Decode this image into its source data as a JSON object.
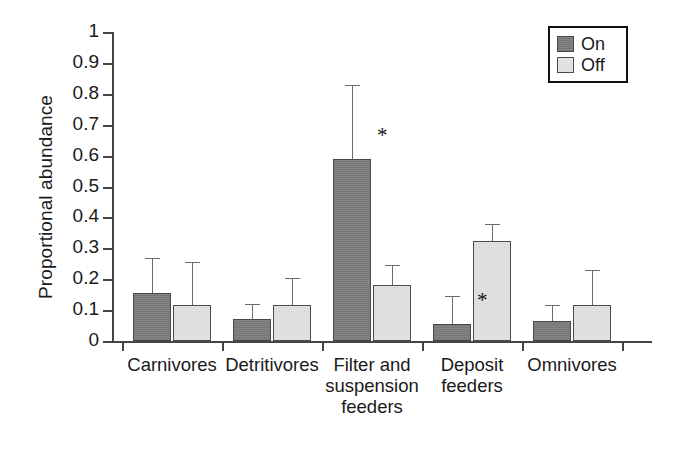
{
  "chart_data": {
    "type": "bar",
    "title": "",
    "xlabel": "",
    "ylabel": "Proportional abundance",
    "ylim": [
      0,
      1
    ],
    "ytick_labels": [
      "0",
      "0.1",
      "0.2",
      "0.3",
      "0.4",
      "0.5",
      "0.6",
      "0.7",
      "0.8",
      "0.9",
      "1"
    ],
    "ytick_values": [
      0,
      0.1,
      0.2,
      0.3,
      0.4,
      0.5,
      0.6,
      0.7,
      0.8,
      0.9,
      1
    ],
    "grid": false,
    "legend_position": "top-right",
    "categories": [
      "Carnivores",
      "Detritivores",
      "Filter and suspension feeders",
      "Deposit feeders",
      "Omnivores"
    ],
    "category_lines": [
      [
        "Carnivores"
      ],
      [
        "Detritivores"
      ],
      [
        "Filter and",
        "suspension",
        "feeders"
      ],
      [
        "Deposit",
        "feeders"
      ],
      [
        "Omnivores"
      ]
    ],
    "series": [
      {
        "name": "On",
        "color": "#7e7e7e",
        "values": [
          0.155,
          0.07,
          0.59,
          0.055,
          0.065
        ],
        "errors": [
          0.115,
          0.05,
          0.24,
          0.09,
          0.05
        ],
        "significant": [
          false,
          false,
          true,
          true,
          false
        ]
      },
      {
        "name": "Off",
        "color": "#e2e2e2",
        "values": [
          0.115,
          0.115,
          0.18,
          0.325,
          0.115
        ],
        "errors": [
          0.14,
          0.09,
          0.065,
          0.055,
          0.115
        ],
        "significant": [
          false,
          false,
          false,
          false,
          false
        ]
      }
    ],
    "annotations": [
      {
        "text": "*",
        "category": "Filter and suspension feeders",
        "series": "On"
      },
      {
        "text": "*",
        "category": "Deposit feeders",
        "series": "Off"
      }
    ]
  },
  "legend": {
    "entries": [
      {
        "label": "On"
      },
      {
        "label": "Off"
      }
    ]
  },
  "axes": {
    "y_title": "Proportional abundance"
  }
}
